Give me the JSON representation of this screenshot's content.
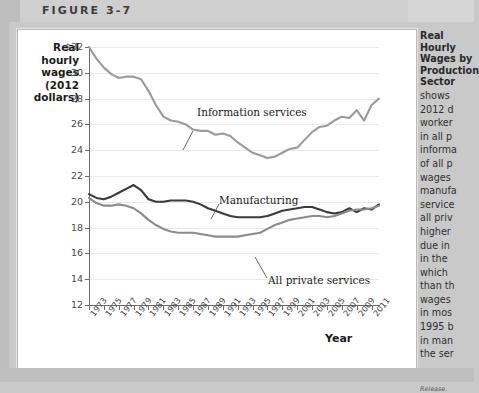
{
  "figure": {
    "label": "FIGURE 3-7"
  },
  "axis_caption": {
    "lines": [
      "Real",
      "hourly",
      "wages",
      "(2012",
      "dollars)"
    ]
  },
  "sidebar": {
    "title_lines": [
      "Real Hourly Wages by",
      "Production Sector"
    ],
    "body_lines": [
      "shows",
      "2012 d",
      "worker",
      "in all p",
      "informa",
      "of all p",
      "wages",
      "manufa",
      "service",
      "all priv",
      "higher",
      "due in",
      "in the",
      "which",
      "than th",
      "wages",
      "in mos",
      "1995 b",
      "in man",
      "the ser"
    ],
    "source_lines": [
      "Source: h",
      "the \"B\" I",
      "Release."
    ]
  },
  "chart_data": {
    "type": "line",
    "title": "",
    "xlabel": "Year",
    "ylabel": "Real hourly wages (2012 dollars)",
    "ylim": [
      12,
      32
    ],
    "yticks": [
      32,
      30,
      28,
      26,
      24,
      22,
      20,
      18,
      16,
      14,
      12
    ],
    "ytick_labels": [
      "$32",
      "30",
      "28",
      "26",
      "24",
      "22",
      "20",
      "18",
      "16",
      "14",
      "12"
    ],
    "xlim": [
      1973,
      2012
    ],
    "xticks": [
      1973,
      1975,
      1977,
      1979,
      1981,
      1983,
      1985,
      1987,
      1989,
      1991,
      1993,
      1995,
      1997,
      1999,
      2001,
      2003,
      2005,
      2007,
      2009,
      2011
    ],
    "xtick_labels": [
      "1973",
      "1975",
      "1977",
      "1979",
      "1981",
      "1983",
      "1985",
      "1987",
      "1989",
      "1991",
      "1993",
      "1995",
      "1997",
      "1999",
      "2001",
      "2003",
      "2005",
      "2007",
      "2009",
      "2011"
    ],
    "grid": true,
    "legend": "inline-annotations",
    "x": [
      1973,
      1974,
      1975,
      1976,
      1977,
      1978,
      1979,
      1980,
      1981,
      1982,
      1983,
      1984,
      1985,
      1986,
      1987,
      1988,
      1989,
      1990,
      1991,
      1992,
      1993,
      1994,
      1995,
      1996,
      1997,
      1998,
      1999,
      2000,
      2001,
      2002,
      2003,
      2004,
      2005,
      2006,
      2007,
      2008,
      2009,
      2010,
      2011,
      2012
    ],
    "series": [
      {
        "name": "Information services",
        "color": "#9a9a9a",
        "label_text": "Information services",
        "values": [
          32.0,
          31.1,
          30.4,
          29.9,
          29.6,
          29.7,
          29.7,
          29.5,
          28.6,
          27.5,
          26.6,
          26.3,
          26.2,
          26.0,
          25.6,
          25.5,
          25.5,
          25.2,
          25.3,
          25.1,
          24.6,
          24.2,
          23.8,
          23.6,
          23.4,
          23.5,
          23.8,
          24.1,
          24.2,
          24.8,
          25.4,
          25.8,
          25.9,
          26.3,
          26.6,
          26.5,
          27.1,
          26.3,
          27.5,
          28.0
        ]
      },
      {
        "name": "Manufacturing",
        "color": "#3a3a3a",
        "label_text": "Manufacturing",
        "values": [
          20.6,
          20.3,
          20.2,
          20.4,
          20.7,
          21.0,
          21.3,
          20.9,
          20.2,
          20.0,
          20.0,
          20.1,
          20.1,
          20.1,
          20.0,
          19.8,
          19.5,
          19.3,
          19.1,
          18.9,
          18.8,
          18.8,
          18.8,
          18.8,
          18.9,
          19.1,
          19.3,
          19.4,
          19.5,
          19.6,
          19.6,
          19.4,
          19.2,
          19.1,
          19.2,
          19.5,
          19.2,
          19.5,
          19.4,
          19.8
        ]
      },
      {
        "name": "All private services",
        "color": "#8b8b8b",
        "label_text": "All private services",
        "values": [
          20.3,
          19.9,
          19.7,
          19.7,
          19.8,
          19.7,
          19.5,
          19.1,
          18.6,
          18.2,
          17.9,
          17.7,
          17.6,
          17.6,
          17.6,
          17.5,
          17.4,
          17.3,
          17.3,
          17.3,
          17.3,
          17.4,
          17.5,
          17.6,
          17.9,
          18.2,
          18.4,
          18.6,
          18.7,
          18.8,
          18.9,
          18.9,
          18.8,
          18.9,
          19.1,
          19.3,
          19.4,
          19.4,
          19.5,
          19.7
        ]
      }
    ]
  }
}
